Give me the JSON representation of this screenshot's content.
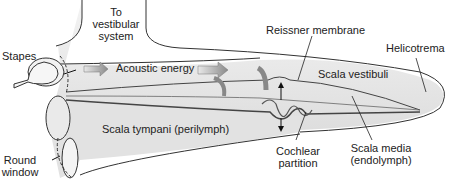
{
  "labels": {
    "stapes": "Stapes",
    "to_vestibular_1": "To",
    "to_vestibular_2": "vestibular",
    "to_vestibular_3": "system",
    "acoustic_energy": "Acoustic energy",
    "reissner": "Reissner membrane",
    "helicotrema": "Helicotrema",
    "scala_vestibuli": "Scala vestibuli",
    "scala_tympani": "Scala tympani (perilymph)",
    "round_window_1": "Round",
    "round_window_2": "window",
    "cochlear_partition_1": "Cochlear",
    "cochlear_partition_2": "partition",
    "scala_media_1": "Scala media",
    "scala_media_2": "(endolymph)"
  },
  "colors": {
    "fill": "#ececec",
    "outline": "#333333",
    "arrow": "#9a9a9a"
  }
}
